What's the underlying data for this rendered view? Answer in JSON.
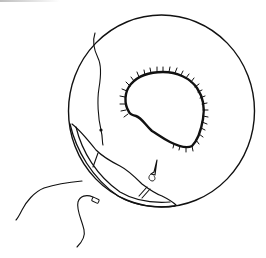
{
  "figure": {
    "type": "line-illustration",
    "colors": {
      "background": "#ffffff",
      "ink": "#111111",
      "top_edge_shade": "#bdbdbd"
    },
    "elements": [
      {
        "name": "outer-circle",
        "description": "large circular outline"
      },
      {
        "name": "central-defect",
        "description": "irregular opening with hatched (fringed) margin"
      },
      {
        "name": "suture-thread-top",
        "description": "wavy thread entering from top, ending in a knot"
      },
      {
        "name": "crescent-band",
        "description": "double-lined crescent strip along lower-left rim with cross bars"
      },
      {
        "name": "needle",
        "description": "small needle pointing upward near lower band"
      },
      {
        "name": "loose-thread-left",
        "description": "curved thread outside circle on left"
      },
      {
        "name": "loose-thread-bottom",
        "description": "S-shaped thread with small tag end below circle"
      }
    ]
  }
}
